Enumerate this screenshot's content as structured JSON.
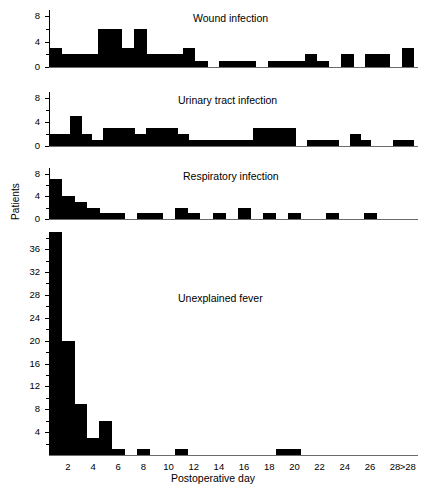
{
  "chart_data": {
    "type": "bar",
    "title": "",
    "xlabel": "Postoperative day",
    "ylabel": "Patients",
    "grid": false,
    "legend": "none",
    "x_tick_labels": [
      "2",
      "4",
      "6",
      "8",
      "10",
      "12",
      "14",
      "16",
      "18",
      "20",
      "22",
      "24",
      "26",
      "28",
      ">28"
    ],
    "categories": [
      "1",
      "2",
      "3",
      "4",
      "5",
      "6",
      "7",
      "8",
      "9",
      "10",
      "11",
      "12",
      "13",
      "14",
      "15",
      "16",
      "17",
      "18",
      "19",
      "20",
      "21",
      "22",
      "23",
      "24",
      "25",
      "26",
      "27",
      "28",
      ">28"
    ],
    "panels": [
      {
        "name": "Wound infection",
        "ylim": [
          0,
          9
        ],
        "y_ticks": [
          0,
          4,
          8
        ],
        "y_tick_labels": [
          "0",
          "4",
          "8"
        ],
        "values": [
          3,
          2,
          2,
          2,
          6,
          6,
          3,
          6,
          2,
          2,
          2,
          3,
          1,
          0,
          1,
          1,
          1,
          0,
          1,
          1,
          1,
          2,
          1,
          0,
          2,
          0,
          2,
          2,
          0,
          3
        ]
      },
      {
        "name": "Urinary tract infection",
        "ylim": [
          0,
          9
        ],
        "y_ticks": [
          0,
          4,
          8
        ],
        "y_tick_labels": [
          "0",
          "4",
          "8"
        ],
        "values": [
          2,
          2,
          5,
          2,
          1,
          3,
          3,
          3,
          2,
          3,
          3,
          3,
          2,
          1,
          1,
          1,
          1,
          1,
          1,
          3,
          3,
          3,
          3,
          0,
          1,
          1,
          1,
          0,
          2,
          1,
          0,
          0,
          1,
          1
        ]
      },
      {
        "name": "Respiratory infection",
        "ylim": [
          0,
          9
        ],
        "y_ticks": [
          0,
          4,
          8
        ],
        "y_tick_labels": [
          "0",
          "4",
          "8"
        ],
        "values": [
          7,
          4,
          3,
          2,
          1,
          1,
          0,
          1,
          1,
          0,
          2,
          1,
          0,
          1,
          0,
          2,
          0,
          1,
          0,
          1,
          0,
          0,
          1,
          0,
          0,
          1
        ]
      },
      {
        "name": "Unexplained fever",
        "ylim": [
          0,
          39
        ],
        "y_ticks": [
          4,
          8,
          12,
          16,
          20,
          24,
          28,
          32,
          36
        ],
        "y_tick_labels": [
          "4",
          "8",
          "12",
          "16",
          "20",
          "24",
          "28",
          "32",
          "36"
        ],
        "values": [
          39,
          20,
          9,
          3,
          6,
          1,
          0,
          1,
          0,
          0,
          1,
          0,
          0,
          0,
          0,
          0,
          0,
          0,
          1,
          1,
          0,
          0,
          0,
          0,
          0,
          0,
          0,
          0,
          0
        ]
      }
    ]
  },
  "axis": {
    "ylabel": "Patients",
    "xlabel": "Postoperative day"
  },
  "panel_titles": {
    "wound": "Wound infection",
    "urinary": "Urinary tract infection",
    "respiratory": "Respiratory infection",
    "fever": "Unexplained fever"
  },
  "colors": {
    "bar": "#000000",
    "axis": "#000000",
    "background": "#ffffff"
  }
}
